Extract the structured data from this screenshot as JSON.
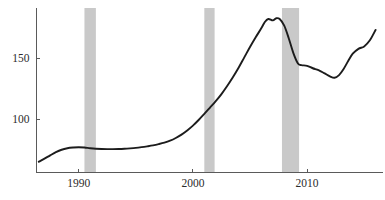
{
  "chart_data": {
    "type": "line",
    "title": "",
    "subtitle": "",
    "xlabel": "",
    "ylabel": "",
    "grid": false,
    "legend": null,
    "legend_position": "none",
    "xlim": [
      1986.3,
      2016.3
    ],
    "ylim": [
      57,
      190
    ],
    "x_ticks": [
      1990,
      2000,
      2010
    ],
    "x_tick_labels": [
      "1990",
      "2000",
      "2010"
    ],
    "y_ticks": [
      100,
      150
    ],
    "y_tick_labels": [
      "100",
      "150"
    ],
    "series": [
      {
        "name": "Index",
        "color": "#1c1c1c",
        "x": [
          1986.5,
          1987.0,
          1987.5,
          1988.0,
          1988.5,
          1989.0,
          1989.5,
          1990.0,
          1990.5,
          1991.0,
          1991.5,
          1992.0,
          1992.5,
          1993.0,
          1993.5,
          1994.0,
          1994.5,
          1995.0,
          1995.5,
          1996.0,
          1996.5,
          1997.0,
          1997.5,
          1998.0,
          1998.5,
          1999.0,
          1999.5,
          2000.0,
          2000.5,
          2001.0,
          2001.5,
          2002.0,
          2002.5,
          2003.0,
          2003.5,
          2004.0,
          2004.5,
          2005.0,
          2005.5,
          2006.0,
          2006.3,
          2006.6,
          2007.0,
          2007.3,
          2007.6,
          2008.0,
          2008.4,
          2008.8,
          2009.2,
          2009.5,
          2010.0,
          2010.5,
          2011.0,
          2011.5,
          2012.0,
          2012.4,
          2012.8,
          2013.2,
          2013.6,
          2014.0,
          2014.5,
          2015.0,
          2015.5,
          2016.0
        ],
        "y": [
          65.0,
          67.5,
          70.2,
          72.8,
          74.8,
          76.0,
          76.6,
          76.9,
          76.6,
          76.0,
          75.6,
          75.4,
          75.3,
          75.3,
          75.4,
          75.6,
          75.9,
          76.3,
          76.9,
          77.6,
          78.4,
          79.4,
          80.6,
          82.2,
          84.4,
          87.2,
          90.6,
          94.6,
          99.2,
          104.2,
          109.4,
          114.6,
          120.4,
          127.0,
          134.2,
          142.0,
          150.5,
          159.0,
          167.0,
          174.5,
          179.5,
          182.0,
          180.8,
          182.6,
          182.0,
          176.5,
          166.0,
          154.0,
          145.5,
          144.2,
          143.6,
          141.6,
          140.0,
          137.6,
          135.0,
          133.8,
          136.0,
          141.0,
          147.5,
          153.5,
          157.5,
          159.5,
          164.5,
          173.0
        ]
      }
    ],
    "shaded_regions": [
      {
        "name": "recession-1990",
        "x0": 1990.5,
        "x1": 1991.5,
        "color": "#c9c9c9"
      },
      {
        "name": "recession-2001",
        "x0": 2001.0,
        "x1": 2001.9,
        "color": "#c9c9c9"
      },
      {
        "name": "recession-2008",
        "x0": 2007.8,
        "x1": 2009.3,
        "color": "#c9c9c9"
      }
    ]
  },
  "axes": {
    "y_axis_label_1": "150",
    "y_axis_label_2": "100",
    "x_axis_label_1": "1990",
    "x_axis_label_2": "2000",
    "x_axis_label_3": "2010"
  }
}
